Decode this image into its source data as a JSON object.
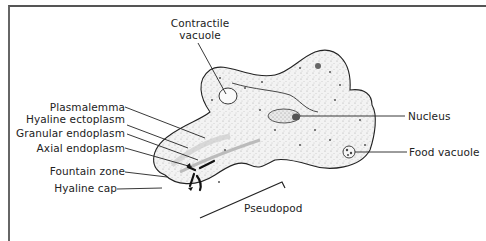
{
  "diagram": {
    "labels": {
      "contractile_vacuole_1": "Contractile",
      "contractile_vacuole_2": "vacuole",
      "plasmalemma": "Plasmalemma",
      "hyaline_ectoplasm": "Hyaline ectoplasm",
      "granular_endoplasm": "Granular endoplasm",
      "axial_endoplasm": "Axial endoplasm",
      "fountain_zone": "Fountain zone",
      "hyaline_cap": "Hyaline cap",
      "nucleus": "Nucleus",
      "food_vacuole": "Food vacuole",
      "pseudopod": "Pseudopod"
    },
    "colors": {
      "outline": "#222222",
      "stipple": "#999999",
      "fill": "#f1f1f1",
      "nucleus": "#9a9a9a"
    }
  }
}
